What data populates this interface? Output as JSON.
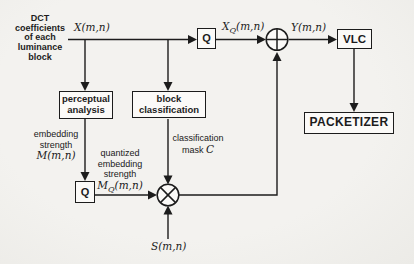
{
  "diagram": {
    "title_hint": "DCT-domain watermark embedding block diagram",
    "input_label": {
      "lines": [
        "DCT",
        "coefficients",
        "of each",
        "luminance",
        "block"
      ]
    },
    "signals": {
      "x": "X(m,n)",
      "xq": {
        "base": "X",
        "sub": "Q",
        "args": "(m,n)"
      },
      "y": "Y(m,n)",
      "m": "M(m,n)",
      "mq": {
        "base": "M",
        "sub": "Q",
        "args": "(m,n)"
      },
      "s": "S(m,n)",
      "c": "C"
    },
    "annotations": {
      "embedding_strength": [
        "embedding",
        "strength"
      ],
      "quantized_embedding_strength": [
        "quantized",
        "embedding",
        "strength"
      ],
      "classification_mask": {
        "line1": "classification",
        "line2_word": "mask"
      }
    },
    "blocks": {
      "quantizer_top": "Q",
      "quantizer_bottom": "Q",
      "perceptual_analysis": [
        "perceptual",
        "analysis"
      ],
      "block_classification": [
        "block",
        "classification"
      ],
      "vlc": "VLC",
      "packetizer": "PACKETIZER"
    },
    "operators": {
      "adder": "plus",
      "multiplier": "times"
    },
    "colors": {
      "ink": "#1c1c1c",
      "background": "#f1f0ed",
      "box_fill": "#fbfaf8"
    }
  }
}
